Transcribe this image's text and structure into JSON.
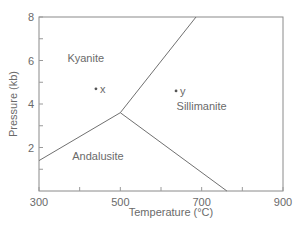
{
  "chart_data": {
    "type": "line",
    "title": "",
    "xlabel": "Temperature (°C)",
    "ylabel": "Pressure (kb)",
    "xlim": [
      300,
      900
    ],
    "ylim": [
      0,
      8
    ],
    "x_ticks": [
      300,
      400,
      500,
      600,
      700,
      800,
      900
    ],
    "x_tick_labels": [
      "300",
      "",
      "500",
      "",
      "700",
      "",
      "900"
    ],
    "y_ticks": [
      1,
      2,
      3,
      4,
      5,
      6,
      7,
      8
    ],
    "y_tick_labels": [
      "",
      "2",
      "",
      "4",
      "",
      "6",
      "",
      "8"
    ],
    "grid": false,
    "series": [
      {
        "name": "Kyanite-Andalusite boundary",
        "points": [
          [
            300,
            1.4
          ],
          [
            500,
            3.6
          ]
        ]
      },
      {
        "name": "Kyanite-Sillimanite boundary",
        "points": [
          [
            500,
            3.6
          ],
          [
            686,
            8.0
          ]
        ]
      },
      {
        "name": "Andalusite-Sillimanite boundary",
        "points": [
          [
            500,
            3.6
          ],
          [
            762,
            0.0
          ]
        ]
      }
    ],
    "regions": [
      {
        "name": "Kyanite",
        "at": [
          415,
          6.1
        ]
      },
      {
        "name": "Sillimanite",
        "at": [
          700,
          3.9
        ]
      },
      {
        "name": "Andalusite",
        "at": [
          445,
          1.6
        ]
      }
    ],
    "marked_points": [
      {
        "label": "x",
        "T": 440,
        "P": 4.7
      },
      {
        "label": "y",
        "T": 637,
        "P": 4.6
      }
    ]
  }
}
